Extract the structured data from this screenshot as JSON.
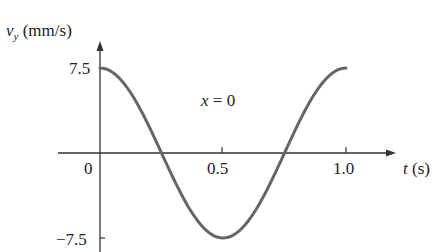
{
  "chart_data": {
    "type": "line",
    "title": "",
    "annotation": "x = 0",
    "xlabel": "t (s)",
    "ylabel": "v_y (mm/s)",
    "x_ticks": [
      "0.5",
      "1.0"
    ],
    "y_ticks": [
      "7.5",
      "0",
      "-7.5"
    ],
    "xlim": [
      0,
      1.0
    ],
    "ylim": [
      -7.5,
      7.5
    ],
    "grid": false,
    "legend": "none",
    "series": [
      {
        "name": "v_y at x = 0",
        "color": "#666666",
        "x": [
          0,
          0.125,
          0.25,
          0.375,
          0.5,
          0.625,
          0.75,
          0.875,
          1.0
        ],
        "y": [
          7.5,
          5.3,
          0,
          -5.3,
          -7.5,
          -5.3,
          0,
          5.3,
          7.5
        ]
      }
    ]
  },
  "labels": {
    "y_axis_var": "v",
    "y_axis_sub": "y",
    "y_axis_unit": " (mm/s)",
    "x_axis_var": "t",
    "x_axis_unit": " (s)",
    "origin": "0",
    "y_max": "7.5",
    "y_min": "−7.5",
    "t_half": "0.5",
    "t_one": "1.0",
    "annotation_var": "x",
    "annotation_rest": " = 0"
  }
}
